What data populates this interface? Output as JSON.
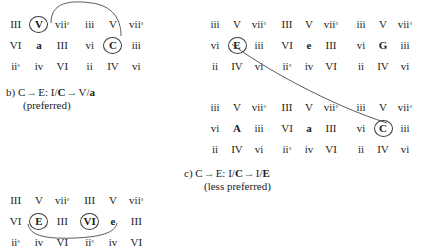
{
  "figure": {
    "groups": [
      {
        "id": "left-top-a",
        "rows": [
          [
            {
              "t": "III"
            },
            {
              "t": "V",
              "circled": true
            },
            {
              "t": "vii",
              "sup": "°"
            }
          ],
          [
            {
              "t": "VI"
            },
            {
              "t": "a",
              "bold": true
            },
            {
              "t": "III"
            }
          ],
          [
            {
              "t": "ii",
              "sup": "°"
            },
            {
              "t": "iv"
            },
            {
              "t": "VI"
            }
          ]
        ]
      },
      {
        "id": "left-top-b",
        "rows": [
          [
            {
              "t": "iii"
            },
            {
              "t": "V"
            },
            {
              "t": "vii",
              "sup": "°"
            }
          ],
          [
            {
              "t": "vi"
            },
            {
              "t": "C",
              "circled": true
            },
            {
              "t": "iii"
            }
          ],
          [
            {
              "t": "ii"
            },
            {
              "t": "IV"
            },
            {
              "t": "vi"
            }
          ]
        ]
      },
      {
        "id": "left-bottom-a",
        "rows": [
          [
            {
              "t": "III"
            },
            {
              "t": "V"
            },
            {
              "t": "vii",
              "sup": "°"
            }
          ],
          [
            {
              "t": "VI"
            },
            {
              "t": "E",
              "circled": true
            },
            {
              "t": "III"
            }
          ],
          [
            {
              "t": "ii",
              "sup": "°"
            },
            {
              "t": "iv"
            },
            {
              "t": "VI"
            }
          ]
        ]
      },
      {
        "id": "left-bottom-b",
        "rows": [
          [
            {
              "t": "III"
            },
            {
              "t": "V"
            },
            {
              "t": "vii",
              "sup": "°"
            }
          ],
          [
            {
              "t": "VI",
              "circled": true
            },
            {
              "t": "e",
              "bold": true
            },
            {
              "t": "III"
            }
          ],
          [
            {
              "t": "ii",
              "sup": "°"
            },
            {
              "t": "iv"
            },
            {
              "t": "VI"
            }
          ]
        ]
      },
      {
        "id": "right-top-a",
        "rows": [
          [
            {
              "t": "iii"
            },
            {
              "t": "V"
            },
            {
              "t": "vii",
              "sup": "°"
            }
          ],
          [
            {
              "t": "vi"
            },
            {
              "t": "E",
              "circled": true
            },
            {
              "t": "iii"
            }
          ],
          [
            {
              "t": "ii"
            },
            {
              "t": "IV"
            },
            {
              "t": "vi"
            }
          ]
        ]
      },
      {
        "id": "right-top-b",
        "rows": [
          [
            {
              "t": "III"
            },
            {
              "t": "V"
            },
            {
              "t": "vii",
              "sup": "°"
            }
          ],
          [
            {
              "t": "VI"
            },
            {
              "t": "e",
              "bold": true
            },
            {
              "t": "III"
            }
          ],
          [
            {
              "t": "ii",
              "sup": "°"
            },
            {
              "t": "iv"
            },
            {
              "t": "VI"
            }
          ]
        ]
      },
      {
        "id": "right-top-c",
        "rows": [
          [
            {
              "t": "iii"
            },
            {
              "t": "V"
            },
            {
              "t": "vii",
              "sup": "°"
            }
          ],
          [
            {
              "t": "vi"
            },
            {
              "t": "G",
              "bold": true
            },
            {
              "t": "iii"
            }
          ],
          [
            {
              "t": "ii"
            },
            {
              "t": "IV"
            },
            {
              "t": "vi"
            }
          ]
        ]
      },
      {
        "id": "right-bottom-a",
        "rows": [
          [
            {
              "t": "iii"
            },
            {
              "t": "V"
            },
            {
              "t": "vii",
              "sup": "°"
            }
          ],
          [
            {
              "t": "vi"
            },
            {
              "t": "A",
              "bold": true
            },
            {
              "t": "iii"
            }
          ],
          [
            {
              "t": "ii"
            },
            {
              "t": "IV"
            },
            {
              "t": "vi"
            }
          ]
        ]
      },
      {
        "id": "right-bottom-b",
        "rows": [
          [
            {
              "t": "III"
            },
            {
              "t": "V"
            },
            {
              "t": "vii",
              "sup": "°"
            }
          ],
          [
            {
              "t": "VI"
            },
            {
              "t": "a",
              "bold": true
            },
            {
              "t": "III"
            }
          ],
          [
            {
              "t": "ii",
              "sup": "°"
            },
            {
              "t": "iv"
            },
            {
              "t": "VI"
            }
          ]
        ]
      },
      {
        "id": "right-bottom-c",
        "rows": [
          [
            {
              "t": "iii"
            },
            {
              "t": "V"
            },
            {
              "t": "vii",
              "sup": "°"
            }
          ],
          [
            {
              "t": "vi"
            },
            {
              "t": "C",
              "circled": true
            },
            {
              "t": "iii"
            }
          ],
          [
            {
              "t": "ii"
            },
            {
              "t": "IV"
            },
            {
              "t": "vi"
            }
          ]
        ]
      }
    ],
    "caption_b": {
      "label": "b)",
      "from": "C",
      "arrow1": "→",
      "to": "E:",
      "term1": "I/",
      "term1_bold": "C",
      "arrow2": "→",
      "term2": "V/",
      "term2_bold": "a",
      "note": "(preferred)"
    },
    "caption_c": {
      "label": "c)",
      "from": "C",
      "arrow1": "→",
      "to": "E:",
      "term1": "I/",
      "term1_bold": "C",
      "arrow2": "→",
      "term2": "I/",
      "term2_bold": "E",
      "note": "(less preferred)"
    },
    "colors": {
      "text": "#1c1c1c",
      "arrow_accent": "#3d6b4a",
      "connector": "#4a4a4a",
      "circle_stroke": "#3b3b3b"
    }
  }
}
